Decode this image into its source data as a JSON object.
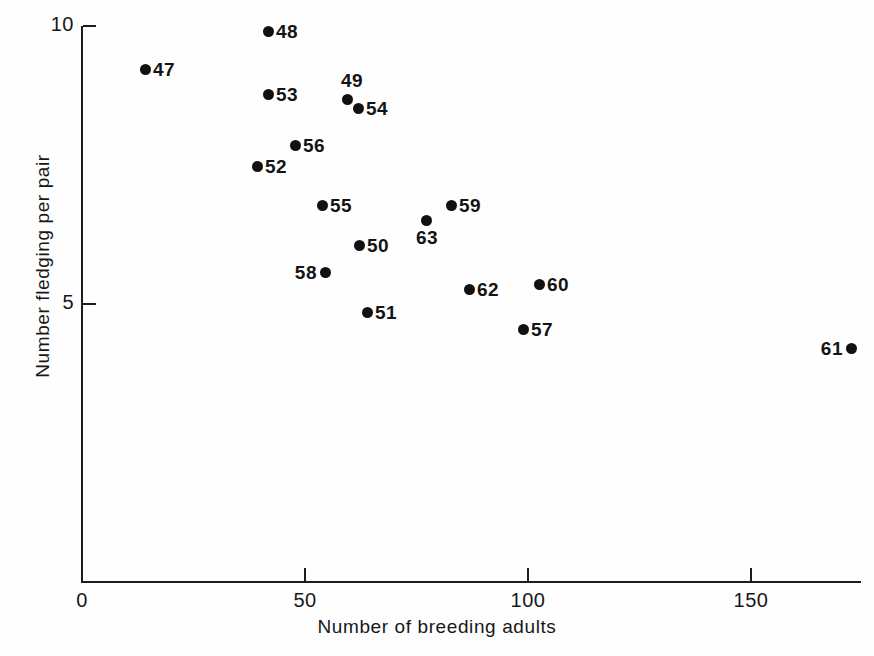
{
  "chart_data": {
    "type": "scatter",
    "title": "",
    "xlabel": "Number of breeding adults",
    "ylabel": "Number fledging per pair",
    "xlim": [
      0,
      175
    ],
    "ylim": [
      0,
      10
    ],
    "grid": false,
    "legend": null,
    "x_ticks": [
      {
        "value": 0,
        "label": "0"
      },
      {
        "value": 50,
        "label": "50"
      },
      {
        "value": 100,
        "label": "100"
      },
      {
        "value": 150,
        "label": "150"
      }
    ],
    "y_ticks": [
      {
        "value": 5,
        "label": "5"
      },
      {
        "value": 10,
        "label": "10"
      }
    ],
    "point_label_note": "Each point is annotated with the two-digit year it represents (1947-1963).",
    "points": [
      {
        "label": "47",
        "x": 14,
        "y": 9.25,
        "px": 145,
        "py": 69,
        "label_pos": "right"
      },
      {
        "label": "48",
        "x": 42,
        "y": 9.9,
        "px": 268,
        "py": 31,
        "label_pos": "right"
      },
      {
        "label": "53",
        "x": 42,
        "y": 8.78,
        "px": 268,
        "py": 94,
        "label_pos": "right"
      },
      {
        "label": "49",
        "x": 59,
        "y": 8.68,
        "px": 347,
        "py": 99,
        "label_pos": "above"
      },
      {
        "label": "54",
        "x": 62,
        "y": 8.52,
        "px": 358,
        "py": 108,
        "label_pos": "right"
      },
      {
        "label": "56",
        "x": 48,
        "y": 7.85,
        "px": 295,
        "py": 145,
        "label_pos": "right"
      },
      {
        "label": "52",
        "x": 39,
        "y": 7.48,
        "px": 257,
        "py": 166,
        "label_pos": "right"
      },
      {
        "label": "55",
        "x": 54,
        "y": 6.78,
        "px": 322,
        "py": 205,
        "label_pos": "right"
      },
      {
        "label": "59",
        "x": 83,
        "y": 6.78,
        "px": 451,
        "py": 205,
        "label_pos": "right"
      },
      {
        "label": "63",
        "x": 77,
        "y": 6.51,
        "px": 426,
        "py": 220,
        "label_pos": "below"
      },
      {
        "label": "50",
        "x": 62,
        "y": 6.06,
        "px": 359,
        "py": 245,
        "label_pos": "right"
      },
      {
        "label": "58",
        "x": 54,
        "y": 5.58,
        "px": 325,
        "py": 272,
        "label_pos": "left"
      },
      {
        "label": "60",
        "x": 102,
        "y": 5.36,
        "px": 539,
        "py": 284,
        "label_pos": "right"
      },
      {
        "label": "62",
        "x": 87,
        "y": 5.27,
        "px": 469,
        "py": 289,
        "label_pos": "right"
      },
      {
        "label": "51",
        "x": 64,
        "y": 4.86,
        "px": 367,
        "py": 312,
        "label_pos": "right"
      },
      {
        "label": "57",
        "x": 99,
        "y": 4.55,
        "px": 523,
        "py": 329,
        "label_pos": "right"
      },
      {
        "label": "61",
        "x": 173,
        "y": 4.21,
        "px": 851,
        "py": 348,
        "label_pos": "left"
      }
    ]
  },
  "axes": {
    "origin_px": {
      "x": 82,
      "y": 582
    },
    "x_scale_px_per_unit": 4.46,
    "y_scale_px_per_unit": 55.6
  }
}
